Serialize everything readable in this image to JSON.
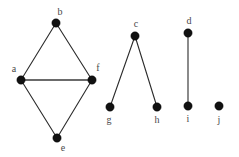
{
  "figure": {
    "background_color": "#ffffff",
    "edge_color": "#2b2b2b",
    "vertex_color": "#111111",
    "label_color": "#4a4a4a",
    "width": 239,
    "height": 157
  },
  "chart_data": {
    "type": "diagram",
    "diagram_kind": "graph",
    "title": "",
    "vertices": [
      {
        "id": "a",
        "label": "a",
        "x": 21,
        "y": 80,
        "r": 4.2,
        "label_x": 14,
        "label_y": 69
      },
      {
        "id": "b",
        "label": "b",
        "x": 56,
        "y": 23,
        "r": 4.2,
        "label_x": 60,
        "label_y": 12
      },
      {
        "id": "c",
        "label": "c",
        "x": 135,
        "y": 36,
        "r": 4.2,
        "label_x": 136,
        "label_y": 24
      },
      {
        "id": "d",
        "label": "d",
        "x": 188,
        "y": 33,
        "r": 4.2,
        "label_x": 189,
        "label_y": 21
      },
      {
        "id": "e",
        "label": "e",
        "x": 57,
        "y": 138,
        "r": 4.2,
        "label_x": 63,
        "label_y": 148
      },
      {
        "id": "f",
        "label": "f",
        "x": 92,
        "y": 80,
        "r": 4.2,
        "label_x": 98,
        "label_y": 68
      },
      {
        "id": "g",
        "label": "g",
        "x": 110,
        "y": 107,
        "r": 4.2,
        "label_x": 109,
        "label_y": 120
      },
      {
        "id": "h",
        "label": "h",
        "x": 157,
        "y": 107,
        "r": 4.2,
        "label_x": 157,
        "label_y": 120
      },
      {
        "id": "i",
        "label": "i",
        "x": 188,
        "y": 106,
        "r": 4.2,
        "label_x": 188,
        "label_y": 119
      },
      {
        "id": "j",
        "label": "j",
        "x": 219,
        "y": 106,
        "r": 4.2,
        "label_x": 219,
        "label_y": 120
      }
    ],
    "edges": [
      {
        "source": "a",
        "target": "b",
        "weight": 1
      },
      {
        "source": "b",
        "target": "f",
        "weight": 1
      },
      {
        "source": "a",
        "target": "f",
        "weight": 2
      },
      {
        "source": "a",
        "target": "e",
        "weight": 1
      },
      {
        "source": "e",
        "target": "f",
        "weight": 1
      },
      {
        "source": "c",
        "target": "g",
        "weight": 1
      },
      {
        "source": "c",
        "target": "h",
        "weight": 1
      },
      {
        "source": "d",
        "target": "i",
        "weight": 1
      }
    ],
    "components": [
      {
        "name": "component-1",
        "vertices": [
          "a",
          "b",
          "f",
          "e"
        ]
      },
      {
        "name": "component-2",
        "vertices": [
          "c",
          "g",
          "h"
        ]
      },
      {
        "name": "component-3",
        "vertices": [
          "d",
          "i"
        ]
      },
      {
        "name": "component-4",
        "vertices": [
          "j"
        ]
      }
    ]
  }
}
